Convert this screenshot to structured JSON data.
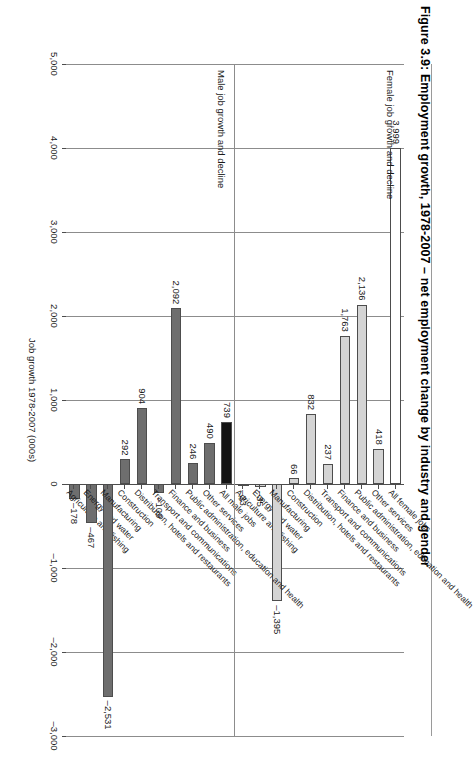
{
  "figure": {
    "title": "Figure 3.9: Employment growth, 1978-2007 – net employment change by industry and gender",
    "axis_title": "Job growth 1978-2007 (000s)",
    "group_male_caption": "Male job growth and decline",
    "group_female_caption": "Female job growth and decline"
  },
  "axis": {
    "ticks": [
      "5,000",
      "4,000",
      "3,000",
      "2,000",
      "1,000",
      "0",
      "–1,000",
      "–2,000",
      "–3,000"
    ],
    "tick_values": [
      5000,
      4000,
      3000,
      2000,
      1000,
      0,
      -1000,
      -2000,
      -3000
    ],
    "min": -3000,
    "max": 5000
  },
  "colors": {
    "male_bar": "#6e6e6e",
    "female_bar": "#d4d4d4",
    "male_total_bar": "#141414",
    "female_total_bar": "#ffffff",
    "axis": "#4d4d4d",
    "grid": "#8c8c8c"
  },
  "chart_data": {
    "type": "bar",
    "title": "Figure 3.9: Employment growth, 1978-2007 – net employment change by industry and gender",
    "xlabel": "",
    "ylabel": "Job growth 1978-2007 (000s)",
    "ylim": [
      -3000,
      5000
    ],
    "grid": true,
    "legend": "none",
    "orientation": "horizontal-rotated",
    "categories": [
      "Agriculture and fishing",
      "Energy and water",
      "Manufacturing",
      "Construction",
      "Distribution, hotels and restaurants",
      "Transport and communications",
      "Finance and business",
      "Public administration, education and health",
      "Other services",
      "All jobs"
    ],
    "series": [
      {
        "name": "Male job growth and decline",
        "values": [
          -178,
          -467,
          -2531,
          292,
          904,
          -109,
          2092,
          246,
          490,
          739
        ],
        "labels": [
          "–178",
          "–467",
          "–2,531",
          "292",
          "904",
          "–109",
          "2,092",
          "246",
          "490",
          "739"
        ],
        "total_label": "All male jobs",
        "total_value": 739
      },
      {
        "name": "Female job growth and decline",
        "values": [
          -23,
          -35,
          -1395,
          66,
          832,
          237,
          1763,
          2136,
          418,
          3999
        ],
        "labels": [
          "–23",
          "–35",
          "–1,395",
          "66",
          "832",
          "237",
          "1,763",
          "2,136",
          "418",
          "3,999"
        ],
        "total_label": "All female jobs",
        "total_value": 3999
      }
    ]
  },
  "male_group": {
    "caption": "Male job growth and decline",
    "bars": [
      {
        "label": "Agriculture and fishing",
        "value": -178,
        "value_label": "–178",
        "style": "male"
      },
      {
        "label": "Energy and water",
        "value": -467,
        "value_label": "–467",
        "style": "male"
      },
      {
        "label": "Manufacturing",
        "value": -2531,
        "value_label": "–2,531",
        "style": "male"
      },
      {
        "label": "Construction",
        "value": 292,
        "value_label": "292",
        "style": "male"
      },
      {
        "label": "Distribution, hotels and restaurants",
        "value": 904,
        "value_label": "904",
        "style": "male"
      },
      {
        "label": "Transport and communications",
        "value": -109,
        "value_label": "–109",
        "style": "male"
      },
      {
        "label": "Finance and business",
        "value": 2092,
        "value_label": "2,092",
        "style": "male"
      },
      {
        "label": "Public administration, education and health",
        "value": 246,
        "value_label": "246",
        "style": "male"
      },
      {
        "label": "Other services",
        "value": 490,
        "value_label": "490",
        "style": "male"
      },
      {
        "label": "All male jobs",
        "value": 739,
        "value_label": "739",
        "style": "total-male"
      }
    ]
  },
  "female_group": {
    "caption": "Female job growth and decline",
    "bars": [
      {
        "label": "Agriculture and fishing",
        "value": -23,
        "value_label": "–23",
        "style": "female"
      },
      {
        "label": "Energy and water",
        "value": -35,
        "value_label": "–35",
        "style": "female"
      },
      {
        "label": "Manufacturing",
        "value": -1395,
        "value_label": "–1,395",
        "style": "female"
      },
      {
        "label": "Construction",
        "value": 66,
        "value_label": "66",
        "style": "female"
      },
      {
        "label": "Distribution, hotels and restaurants",
        "value": 832,
        "value_label": "832",
        "style": "female"
      },
      {
        "label": "Transport and communications",
        "value": 237,
        "value_label": "237",
        "style": "female"
      },
      {
        "label": "Finance and business",
        "value": 1763,
        "value_label": "1,763",
        "style": "female"
      },
      {
        "label": "Public administration, education and health",
        "value": 2136,
        "value_label": "2,136",
        "style": "female"
      },
      {
        "label": "Other services",
        "value": 418,
        "value_label": "418",
        "style": "female"
      },
      {
        "label": "All female jobs",
        "value": 3999,
        "value_label": "3,999",
        "style": "total-female"
      }
    ]
  }
}
